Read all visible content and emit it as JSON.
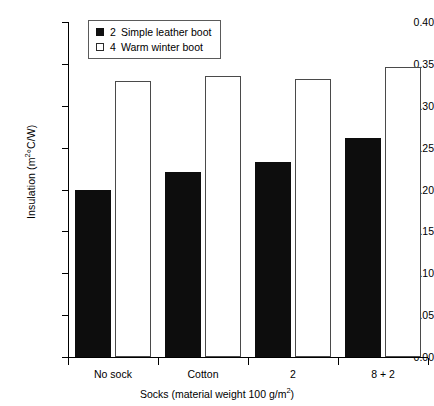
{
  "chart_data": {
    "type": "bar",
    "title": "",
    "xlabel": "Socks (material weight 100 g/m²)",
    "ylabel": "Insulation (m²°C/W)",
    "categories": [
      "No sock",
      "Cotton",
      "2",
      "8 + 2"
    ],
    "series": [
      {
        "name": "2  Simple leather boot",
        "key": "2",
        "label": "Simple leather boot",
        "style": "filled",
        "color": "#0d0d0d",
        "values": [
          0.199,
          0.221,
          0.233,
          0.262
        ]
      },
      {
        "name": "4  Warm winter boot",
        "key": "4",
        "label": "Warm winter boot",
        "style": "open",
        "color": "#ffffff",
        "values": [
          0.329,
          0.335,
          0.332,
          0.346
        ]
      }
    ],
    "ylim": [
      0.0,
      0.4
    ],
    "yticks": [
      "0.00",
      "0.05",
      "0.10",
      "0.15",
      "0.20",
      "0.25",
      "0.30",
      "0.35",
      "0.40"
    ],
    "ytick_values": [
      0.0,
      0.05,
      0.1,
      0.15,
      0.2,
      0.25,
      0.3,
      0.35,
      0.4
    ],
    "grid": false,
    "legend_position": "top-left-inside"
  },
  "axes": {
    "y_title_main": "Insulation (m",
    "y_title_sup": "2",
    "y_title_tail": "°C/W)",
    "x_title_main": "Socks (material weight 100 g/m",
    "x_title_sup": "2",
    "x_title_tail": ")"
  },
  "legend": {
    "items": [
      {
        "key": "2",
        "label": "Simple leather boot",
        "style": "filled"
      },
      {
        "key": "4",
        "label": "Warm winter boot",
        "style": "open"
      }
    ]
  }
}
